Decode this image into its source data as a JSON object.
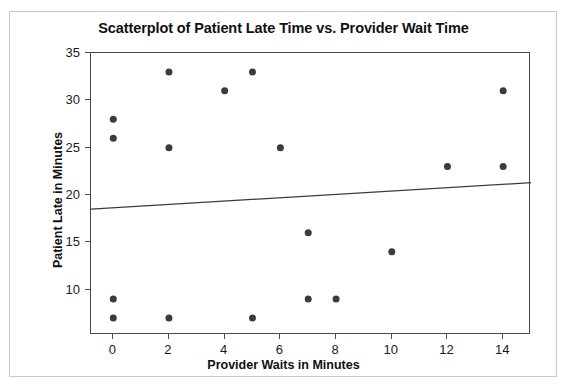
{
  "chart_data": {
    "type": "scatter",
    "title": "Scatterplot of Patient Late Time vs. Provider Wait Time",
    "xlabel": "Provider Waits in Minutes",
    "ylabel": "Patient Late in Minutes",
    "xlim": [
      -0.8,
      15.0
    ],
    "ylim": [
      5.2,
      35.0
    ],
    "xticks": [
      0,
      2,
      4,
      6,
      8,
      10,
      12,
      14
    ],
    "xtick_labels": [
      "0",
      "2",
      "4",
      "6",
      "8",
      "10",
      "12",
      "14"
    ],
    "yticks": [
      10,
      15,
      20,
      25,
      30,
      35
    ],
    "ytick_labels": [
      "10",
      "15",
      "20",
      "25",
      "30",
      "35"
    ],
    "grid": false,
    "legend": false,
    "marker_color": "#3b3b3b",
    "marker_size": 7,
    "points": [
      {
        "x": 0,
        "y": 28
      },
      {
        "x": 0,
        "y": 26
      },
      {
        "x": 0,
        "y": 9
      },
      {
        "x": 0,
        "y": 7
      },
      {
        "x": 2,
        "y": 33
      },
      {
        "x": 2,
        "y": 25
      },
      {
        "x": 2,
        "y": 7
      },
      {
        "x": 4,
        "y": 31
      },
      {
        "x": 5,
        "y": 33
      },
      {
        "x": 5,
        "y": 7
      },
      {
        "x": 6,
        "y": 25
      },
      {
        "x": 7,
        "y": 16
      },
      {
        "x": 7,
        "y": 9
      },
      {
        "x": 8,
        "y": 9
      },
      {
        "x": 10,
        "y": 14
      },
      {
        "x": 12,
        "y": 23
      },
      {
        "x": 14,
        "y": 31
      },
      {
        "x": 14,
        "y": 23
      }
    ],
    "trend_line": {
      "color": "#3b3b3b",
      "x_start": -0.8,
      "y_start": 18.5,
      "x_end": 15.0,
      "y_end": 21.3
    }
  }
}
